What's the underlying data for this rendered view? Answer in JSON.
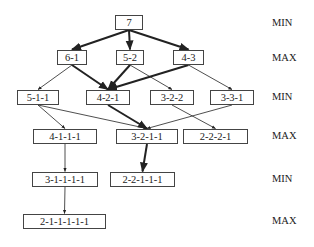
{
  "diagram": {
    "type": "game-tree",
    "nodes": [
      {
        "id": "n7",
        "label": "7",
        "x": 115,
        "y": 15,
        "w": 28,
        "level": 0
      },
      {
        "id": "n61",
        "label": "6-1",
        "x": 57,
        "y": 50,
        "w": 30,
        "level": 1
      },
      {
        "id": "n52",
        "label": "5-2",
        "x": 116,
        "y": 50,
        "w": 28,
        "level": 1
      },
      {
        "id": "n43",
        "label": "4-3",
        "x": 173,
        "y": 50,
        "w": 31,
        "level": 1
      },
      {
        "id": "n511",
        "label": "5-1-1",
        "x": 17,
        "y": 90,
        "w": 42,
        "level": 2
      },
      {
        "id": "n421",
        "label": "4-2-1",
        "x": 86,
        "y": 90,
        "w": 44,
        "level": 2
      },
      {
        "id": "n322",
        "label": "3-2-2",
        "x": 150,
        "y": 90,
        "w": 44,
        "level": 2
      },
      {
        "id": "n331",
        "label": "3-3-1",
        "x": 210,
        "y": 90,
        "w": 44,
        "level": 2
      },
      {
        "id": "n4111",
        "label": "4-1-1-1",
        "x": 33,
        "y": 129,
        "w": 64,
        "level": 3
      },
      {
        "id": "n3211",
        "label": "3-2-1-1",
        "x": 116,
        "y": 129,
        "w": 62,
        "level": 3
      },
      {
        "id": "n2221",
        "label": "2-2-2-1",
        "x": 183,
        "y": 129,
        "w": 65,
        "level": 3
      },
      {
        "id": "n31111",
        "label": "3-1-1-1-1",
        "x": 32,
        "y": 172,
        "w": 66,
        "level": 4
      },
      {
        "id": "n22111",
        "label": "2-2-1-1-1",
        "x": 110,
        "y": 172,
        "w": 65,
        "level": 4
      },
      {
        "id": "n211111",
        "label": "2-1-1-1-1-1",
        "x": 23,
        "y": 214,
        "w": 83,
        "level": 5
      }
    ],
    "edges": [
      {
        "from": "n7",
        "to": "n61",
        "bold": true
      },
      {
        "from": "n7",
        "to": "n52",
        "bold": true
      },
      {
        "from": "n7",
        "to": "n43",
        "bold": true
      },
      {
        "from": "n61",
        "to": "n511",
        "bold": false
      },
      {
        "from": "n61",
        "to": "n421",
        "bold": true
      },
      {
        "from": "n52",
        "to": "n421",
        "bold": true
      },
      {
        "from": "n52",
        "to": "n322",
        "bold": false
      },
      {
        "from": "n43",
        "to": "n421",
        "bold": true
      },
      {
        "from": "n43",
        "to": "n331",
        "bold": false
      },
      {
        "from": "n511",
        "to": "n4111",
        "bold": false
      },
      {
        "from": "n511",
        "to": "n3211",
        "bold": false
      },
      {
        "from": "n421",
        "to": "n3211",
        "bold": true
      },
      {
        "from": "n322",
        "to": "n2221",
        "bold": false
      },
      {
        "from": "n331",
        "to": "n3211",
        "bold": false
      },
      {
        "from": "n4111",
        "to": "n31111",
        "bold": false
      },
      {
        "from": "n3211",
        "to": "n22111",
        "bold": true
      },
      {
        "from": "n31111",
        "to": "n211111",
        "bold": false
      }
    ],
    "level_labels": [
      {
        "label": "MIN",
        "y": 17
      },
      {
        "label": "MAX",
        "y": 52
      },
      {
        "label": "MIN",
        "y": 91
      },
      {
        "label": "MAX",
        "y": 130
      },
      {
        "label": "MIN",
        "y": 173
      },
      {
        "label": "MAX",
        "y": 215
      }
    ],
    "colors": {
      "line": "#222222",
      "box_border": "#444444",
      "text": "#222222"
    }
  }
}
